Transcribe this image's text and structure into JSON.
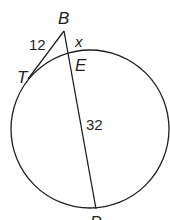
{
  "diagram": {
    "type": "circle-tangent-secant",
    "stroke_color": "#231f20",
    "background": "#ffffff",
    "points": {
      "B": {
        "label": "B",
        "x": 64,
        "y": 31
      },
      "T": {
        "label": "T",
        "x": 34,
        "y": 71
      },
      "E": {
        "label": "E",
        "x": 69,
        "y": 52
      },
      "P": {
        "label": "P",
        "x": 96,
        "y": 208
      }
    },
    "circle": {
      "cx": 90,
      "cy": 129,
      "r": 79
    },
    "segments": [
      {
        "from": "B",
        "to": "T",
        "kind": "tangent",
        "length_label": "12"
      },
      {
        "from": "B",
        "to": "E",
        "kind": "external-secant",
        "length_label": "x"
      },
      {
        "from": "E",
        "to": "P",
        "kind": "chord",
        "length_label": "32"
      }
    ],
    "labels": {
      "B": "B",
      "T": "T",
      "E": "E",
      "P": "P",
      "tangent_length": "12",
      "external_length": "x",
      "chord_length": "32"
    }
  }
}
